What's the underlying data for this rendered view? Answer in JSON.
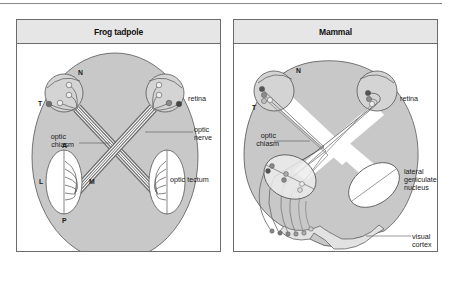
{
  "figure": {
    "panels": [
      {
        "title": "Frog tadpole",
        "labels": {
          "nasal": "N",
          "temporal": "T",
          "retina": "retina",
          "optic_nerve_1": "optic",
          "optic_nerve_2": "nerve",
          "optic_chiasm_1": "optic",
          "optic_chiasm_2": "chiasm",
          "anterior": "A",
          "posterior": "P",
          "lateral": "L",
          "medial": "M",
          "optic_tectum": "optic tectum"
        }
      },
      {
        "title": "Mammal",
        "labels": {
          "nasal": "N",
          "temporal": "T",
          "retina": "retina",
          "optic_chiasm_1": "optic",
          "optic_chiasm_2": "chiasm",
          "lgn_1": "lateral",
          "lgn_2": "geniculate",
          "lgn_3": "nucleus",
          "visual_cortex_1": "visual",
          "visual_cortex_2": "cortex"
        }
      }
    ],
    "colors": {
      "brain_fill": "#c8c8c8",
      "outline": "#555555",
      "fiber_dark": "#6e6e6e",
      "fiber_light": "#ffffff",
      "cell_dark": "#555555",
      "cell_mid": "#8c8c8c",
      "cell_light": "#ededed",
      "header_bg": "#e6e6e6"
    }
  }
}
